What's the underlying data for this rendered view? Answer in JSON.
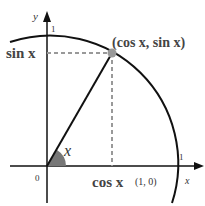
{
  "diagram": {
    "labels": {
      "y_axis": "y",
      "x_axis": "x",
      "y_one": "1",
      "x_one": "1",
      "origin": "0",
      "point": "(cos x, sin x)",
      "sin": "sin x",
      "cos": "cos x",
      "unit_point": "(1, 0)",
      "angle": "x"
    },
    "colors": {
      "line": "#111111",
      "dashed": "#999999",
      "point": "#999999",
      "angle_fill": "#777777"
    }
  }
}
